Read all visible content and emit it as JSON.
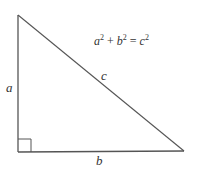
{
  "diagram": {
    "type": "right-triangle",
    "vertices": {
      "top": [
        18,
        15
      ],
      "right_angle": [
        18,
        152
      ],
      "bottom_right": [
        184,
        151
      ]
    },
    "right_angle_marker_size": 13,
    "stroke_color": "#555555",
    "text_color": "#333333",
    "labels": {
      "a": "a",
      "b": "b",
      "c": "c"
    },
    "formula": {
      "term1": "a",
      "exp1": "2",
      "plus": " + ",
      "term2": "b",
      "exp2": "2",
      "equals": " = ",
      "term3": "c",
      "exp3": "2",
      "full_text": "a² + b² = c²"
    }
  }
}
